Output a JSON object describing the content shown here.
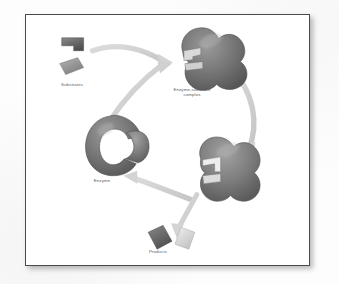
{
  "figure": {
    "background_color": "#ffffff",
    "frame_color": "#4a4a4a",
    "page_color": "#fdfdfd",
    "label_color": "#5d5d5d",
    "arrow_color": "#d2d2d2",
    "molecule_dark_color": "#6b6b6b",
    "molecule_light_color": "#d8d8d8"
  },
  "labels": {
    "substrates": "Substrates",
    "complex": "Enzyme-substrate\ncomplex",
    "enzyme": "Enzyme",
    "products": "Products"
  },
  "stages": [
    {
      "id": "substrates",
      "label": "Substrates",
      "position": "top-left"
    },
    {
      "id": "enzyme-substrate-complex",
      "label": "Enzyme-substrate complex",
      "position": "top-right"
    },
    {
      "id": "enzyme-product-complex",
      "label": "",
      "position": "bottom-right"
    },
    {
      "id": "products",
      "label": "Products",
      "position": "bottom-center"
    },
    {
      "id": "enzyme",
      "label": "Enzyme",
      "position": "left"
    }
  ],
  "arrows": [
    {
      "id": "substrates-to-complex",
      "from": "Substrates",
      "to": "Enzyme-substrate complex"
    },
    {
      "id": "enzyme-to-complex",
      "from": "Enzyme",
      "to": "Enzyme-substrate complex"
    },
    {
      "id": "complex-to-product-complex",
      "from": "Enzyme-substrate complex",
      "to": "Enzyme-product complex"
    },
    {
      "id": "product-complex-to-enzyme",
      "from": "Enzyme-product complex",
      "to": "Enzyme"
    },
    {
      "id": "product-complex-to-products",
      "from": "Enzyme-product complex",
      "to": "Products"
    }
  ]
}
